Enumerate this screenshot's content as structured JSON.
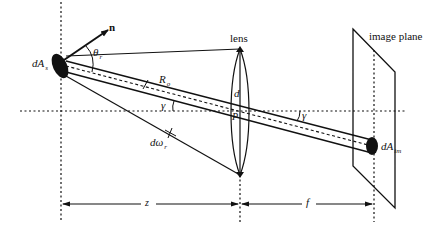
{
  "figure": {
    "colors": {
      "ink": "#111111",
      "background": "#ffffff"
    }
  },
  "labels": {
    "lens": "lens",
    "image_plane": "image plane",
    "normal": "n",
    "theta_r": "θ",
    "theta_r_sub": "r",
    "dA_s": "dA",
    "dA_s_sub": "s",
    "R_o": "R",
    "R_o_sub": "o",
    "gamma_left": "γ",
    "gamma_right": "γ",
    "d": "d",
    "P": "P",
    "d_omega_r": "dω",
    "d_omega_r_sub": "r",
    "dA_im": "dA",
    "dA_im_sub": "im",
    "z": "z",
    "f": "f"
  }
}
